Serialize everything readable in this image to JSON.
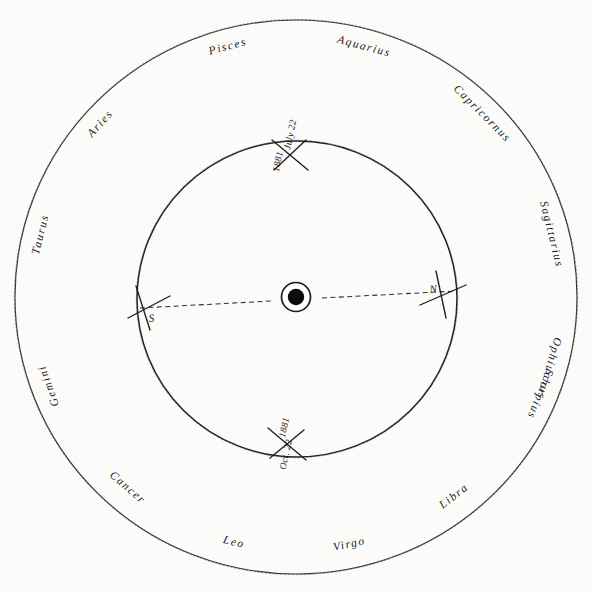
{
  "figure": {
    "type": "astronomical-orbit-chart",
    "background_color": "#fdfdfc",
    "ink_color": "#201e1c"
  },
  "zodiac_ring": {
    "name": "zodiac-band",
    "labels": [
      {
        "text": "Pisces",
        "angle_deg": -105,
        "flip": false
      },
      {
        "text": "Aquarius",
        "angle_deg": -75,
        "flip": false
      },
      {
        "text": "Capricornus",
        "angle_deg": -45,
        "flip": false
      },
      {
        "text": "Sagittarius",
        "angle_deg": -14,
        "flip": false
      },
      {
        "text": "Ophiuchus",
        "angle_deg": 16,
        "flip": false
      },
      {
        "text": "Scorpius",
        "angle_deg": 22,
        "flip": false
      },
      {
        "text": "Libra",
        "angle_deg": 52,
        "flip": true
      },
      {
        "text": "Virgo",
        "angle_deg": 78,
        "flip": true
      },
      {
        "text": "Leo",
        "angle_deg": 104,
        "flip": true
      },
      {
        "text": "Cancer",
        "angle_deg": 131,
        "flip": true
      },
      {
        "text": "Gemini",
        "angle_deg": 160,
        "flip": false
      },
      {
        "text": "Taurus",
        "angle_deg": 194,
        "flip": false
      },
      {
        "text": "Aries",
        "angle_deg": 222,
        "flip": false
      }
    ]
  },
  "orbit": {
    "name": "comet-orbit",
    "markers": [
      {
        "id": "marker-july",
        "date": "July 22",
        "year": "1881",
        "position": "top"
      },
      {
        "id": "marker-october",
        "date": "Oct. 22",
        "year": "1881",
        "position": "bottom"
      }
    ]
  },
  "nodes": {
    "descending_label": "S",
    "ascending_label": "N"
  },
  "sun": {
    "name": "sun-symbol",
    "label": ""
  },
  "chart_data": {
    "type": "scatter",
    "xlabel": "",
    "ylabel": "",
    "grid": false,
    "legend": "none",
    "annotations": [
      "July 22, 1881",
      "Oct. 22, 1881",
      "S",
      "N"
    ],
    "categories": [
      "Pisces",
      "Aquarius",
      "Capricornus",
      "Sagittarius",
      "Ophiuchus",
      "Scorpius",
      "Libra",
      "Virgo",
      "Leo",
      "Cancer",
      "Gemini",
      "Taurus",
      "Aries"
    ],
    "series": [
      {
        "name": "zodiac-ring",
        "shape": "circle",
        "center": [
          296,
          297
        ],
        "radius_px": 281
      },
      {
        "name": "orbit-path",
        "shape": "circle",
        "center": [
          297,
          299
        ],
        "radius_px": 160
      },
      {
        "name": "line-of-nodes",
        "shape": "line",
        "from": [
          142,
          308
        ],
        "to": [
          452,
          293
        ],
        "style": "dashed"
      },
      {
        "name": "sun",
        "shape": "point",
        "x": 296,
        "y": 297
      }
    ]
  }
}
